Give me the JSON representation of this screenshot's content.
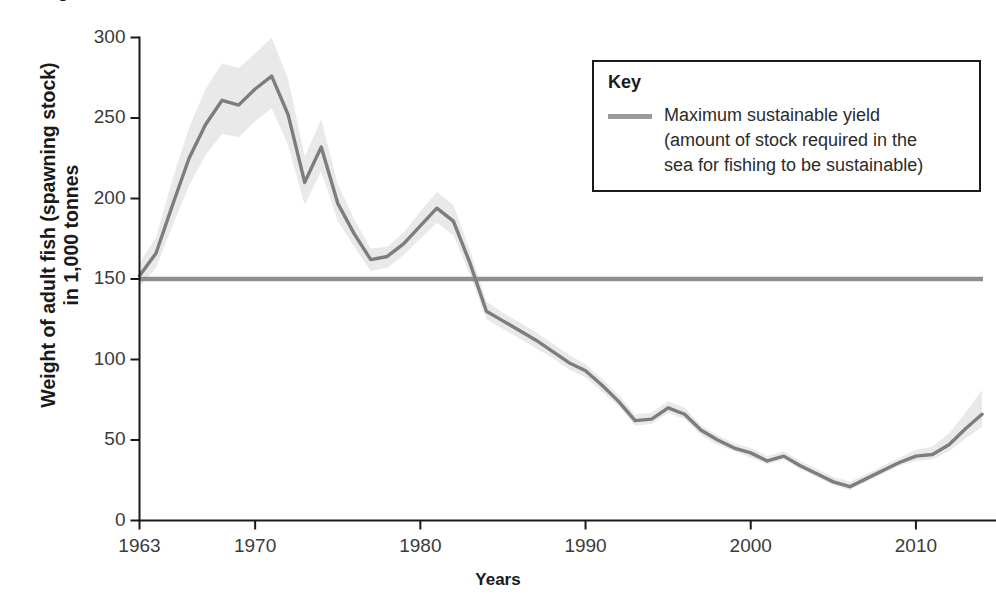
{
  "title": "Weight of adult fish in the North Sea",
  "axes": {
    "y_title_line1": "Weight of adult fish (spawning stock)",
    "y_title_line2": "in 1,000 tonnes",
    "x_title": "Years",
    "y_ticks": [
      "0",
      "50",
      "100",
      "150",
      "200",
      "250",
      "300"
    ],
    "x_ticks": [
      "1963",
      "1970",
      "1980",
      "1990",
      "2000",
      "2010"
    ]
  },
  "legend": {
    "title": "Key",
    "swatch_color": "#9a9a9a",
    "label_line1": "Maximum sustainable yield",
    "label_line2": "(amount of stock required in the",
    "label_line3": "sea for fishing to be sustainable)"
  },
  "colors": {
    "line": "#7d7d7d",
    "band": "#e9e9e9",
    "msy_line": "#8e8e8e",
    "axis": "#1a1a1a",
    "text": "#2b2b2b"
  },
  "chart_data": {
    "type": "line",
    "title": "Weight of adult fish in the North Sea",
    "xlabel": "Years",
    "ylabel": "Weight of adult fish (spawning stock) in 1,000 tonnes",
    "xlim": [
      1963,
      2014
    ],
    "ylim": [
      0,
      300
    ],
    "grid": false,
    "legend_position": "top-right",
    "annotations": [
      "Maximum sustainable yield (amount of stock required in the sea for fishing to be sustainable) = 150"
    ],
    "msy_value": 150,
    "x": [
      1963,
      1964,
      1965,
      1966,
      1967,
      1968,
      1969,
      1970,
      1971,
      1972,
      1973,
      1974,
      1975,
      1976,
      1977,
      1978,
      1979,
      1980,
      1981,
      1982,
      1983,
      1984,
      1985,
      1986,
      1987,
      1988,
      1989,
      1990,
      1991,
      1992,
      1993,
      1994,
      1995,
      1996,
      1997,
      1998,
      1999,
      2000,
      2001,
      2002,
      2003,
      2004,
      2005,
      2006,
      2007,
      2008,
      2009,
      2010,
      2011,
      2012,
      2013,
      2014
    ],
    "series": [
      {
        "name": "Spawning stock biomass",
        "values": [
          152,
          166,
          196,
          225,
          246,
          261,
          258,
          268,
          276,
          252,
          210,
          232,
          197,
          178,
          162,
          164,
          172,
          183,
          194,
          186,
          160,
          130,
          124,
          118,
          112,
          105,
          98,
          93,
          84,
          74,
          62,
          63,
          70,
          66,
          56,
          50,
          45,
          42,
          37,
          40,
          34,
          29,
          24,
          21,
          26,
          31,
          36,
          40,
          41,
          47,
          57,
          66
        ]
      },
      {
        "name": "Upper confidence bound",
        "values": [
          160,
          176,
          212,
          244,
          268,
          284,
          281,
          290,
          300,
          274,
          226,
          249,
          209,
          187,
          169,
          170,
          179,
          192,
          204,
          196,
          168,
          136,
          129,
          123,
          117,
          110,
          103,
          97,
          88,
          78,
          66,
          67,
          74,
          70,
          59,
          53,
          48,
          45,
          40,
          43,
          37,
          32,
          27,
          24,
          29,
          34,
          39,
          44,
          46,
          54,
          67,
          81
        ]
      },
      {
        "name": "Lower confidence bound",
        "values": [
          145,
          157,
          183,
          208,
          227,
          240,
          238,
          248,
          256,
          233,
          196,
          217,
          186,
          170,
          155,
          157,
          165,
          175,
          185,
          177,
          153,
          125,
          119,
          113,
          107,
          101,
          94,
          89,
          80,
          71,
          59,
          60,
          67,
          63,
          53,
          47,
          43,
          39,
          35,
          38,
          32,
          27,
          22,
          19,
          24,
          29,
          34,
          37,
          38,
          43,
          51,
          58
        ]
      }
    ]
  }
}
